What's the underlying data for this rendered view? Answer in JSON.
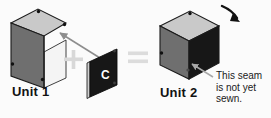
{
  "figure": {
    "kind": "sewing-assembly-diagram",
    "background_color": "#fbfbfb",
    "width": 271,
    "height": 118,
    "unit1": {
      "label": "Unit 1",
      "description": "open-box-two-panels",
      "top_face_color": "#c9c9c9",
      "left_face_color": "#6f6f6f",
      "inner_face_color": "#f2f2f2",
      "outline_color": "#1b1b1b",
      "corner_dot_color": "#101010"
    },
    "plus_operator": {
      "symbol": "+",
      "color": "#d8d8d8"
    },
    "panel_c": {
      "label": "C",
      "label_color": "#ffffff",
      "face_color": "#171717",
      "edge_color": "#cfcfcf",
      "outline_color": "#0d0d0d"
    },
    "equals_operator": {
      "symbol": "=",
      "color": "#dcdcdc"
    },
    "unit2": {
      "label": "Unit 2",
      "description": "closed-cube-three-faces",
      "top_face_color": "#c9c9c9",
      "left_face_color": "#6f6f6f",
      "right_face_color": "#171717",
      "outline_color": "#1b1b1b",
      "corner_dot_color": "#101010"
    },
    "assembly_arrow": {
      "name": "panel-c-to-unit1-arrow",
      "color": "#8d8d8d",
      "direction": "up-left"
    },
    "seam_arrow": {
      "name": "seam-pointer-arrow",
      "color": "#a8a8a8",
      "direction": "up-left"
    },
    "rotation_arrow": {
      "name": "rotation-arrow",
      "color": "#111111",
      "direction": "down-right"
    },
    "annotation": {
      "name": "seam-note",
      "lines": [
        "This seam",
        "is not yet",
        "sewn."
      ],
      "line1": "This seam",
      "line2": "is not yet",
      "line3": "sewn."
    }
  }
}
